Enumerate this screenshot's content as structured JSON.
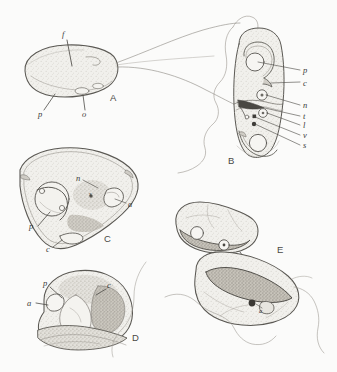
{
  "figure": {
    "kind": "biological-line-drawing",
    "panel_count": 5,
    "background_color": "#fbfbfa",
    "ink_color": "#55534e",
    "fill_color": "#ecebe6",
    "stipple_color": "#b9b6ae",
    "dark_fill_color": "#9b978e"
  },
  "panels": [
    {
      "id": "A",
      "label": "A",
      "label_x": 111,
      "label_y": 98,
      "description": "elongate oval cell in lateral view with two trailing flagella",
      "callouts": [
        {
          "text": "f",
          "x": 64,
          "y": 35,
          "desc": "flagellum"
        },
        {
          "text": "p",
          "x": 38,
          "y": 114,
          "desc": "pellicle"
        },
        {
          "text": "o",
          "x": 83,
          "y": 114,
          "desc": "organelle"
        }
      ]
    },
    {
      "id": "B",
      "label": "B",
      "label_x": 229,
      "label_y": 160,
      "description": "dividing elongate cell, two daughter bodies, with seven labelled internal structures",
      "callouts": [
        {
          "text": "p",
          "x": 303,
          "y": 72,
          "desc": "pellicle"
        },
        {
          "text": "c",
          "x": 303,
          "y": 85,
          "desc": "chromatin body"
        },
        {
          "text": "n",
          "x": 303,
          "y": 108,
          "desc": "nucleus"
        },
        {
          "text": "t",
          "x": 303,
          "y": 119,
          "desc": "tubule"
        },
        {
          "text": "l",
          "x": 303,
          "y": 128,
          "desc": "lipid body"
        },
        {
          "text": "v",
          "x": 303,
          "y": 138,
          "desc": "vacuole"
        },
        {
          "text": "s",
          "x": 303,
          "y": 148,
          "desc": "spindle"
        }
      ]
    },
    {
      "id": "C",
      "label": "C",
      "label_x": 105,
      "label_y": 239,
      "description": "triangular sectioned cell with nucleus, apical organelle and cyst wall",
      "callouts": [
        {
          "text": "n",
          "x": 77,
          "y": 178,
          "desc": "nucleus"
        },
        {
          "text": "a",
          "x": 128,
          "y": 203,
          "desc": "apical organelle"
        },
        {
          "text": "p",
          "x": 31,
          "y": 227,
          "desc": "pellicle"
        },
        {
          "text": "c",
          "x": 47,
          "y": 249,
          "desc": "cyst wall"
        },
        {
          "text": "s",
          "x": 91,
          "y": 195,
          "desc": "small granule"
        }
      ]
    },
    {
      "id": "D",
      "label": "D",
      "label_x": 133,
      "label_y": 338,
      "description": "rounded sectioned cell with pellicle, apical organelle and chromatin body",
      "callouts": [
        {
          "text": "p",
          "x": 44,
          "y": 283,
          "desc": "pellicle"
        },
        {
          "text": "a",
          "x": 29,
          "y": 303,
          "desc": "apical organelle"
        },
        {
          "text": "c",
          "x": 108,
          "y": 285,
          "desc": "chromatin body"
        }
      ]
    },
    {
      "id": "E",
      "label": "E",
      "label_x": 278,
      "label_y": 250,
      "description": "paired bilobed cells joined, each enclosing a dark crescentic mass",
      "callouts": [
        {
          "text": "a",
          "x": 261,
          "y": 311,
          "desc": "apical organelle"
        }
      ]
    }
  ]
}
